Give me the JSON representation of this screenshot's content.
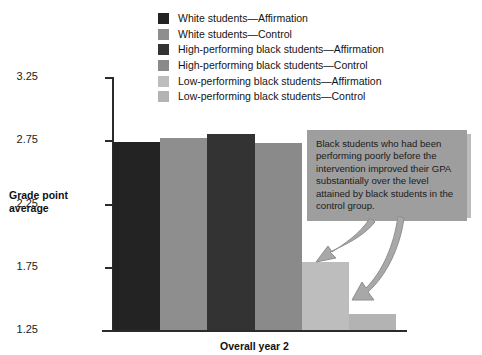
{
  "chart_data": {
    "type": "bar",
    "title": "",
    "subtitle": "",
    "xlabel": "Overall year 2",
    "ylabel": "Grade point average",
    "ylim": [
      1.25,
      3.25
    ],
    "yticks": [
      "3.25",
      "2.75",
      "2.25",
      "1.75",
      "1.25"
    ],
    "ytick_values": [
      3.25,
      2.75,
      2.25,
      1.75,
      1.25
    ],
    "grid": false,
    "legend_position": "top-center",
    "categories": [
      "White students—Affirmation",
      "White students—Control",
      "High-performing black students—Affirmation",
      "High-performing black students—Control",
      "Low-performing black students—Affirmation",
      "Low-performing black students—Control"
    ],
    "values": [
      2.74,
      2.77,
      2.8,
      2.73,
      1.79,
      1.38
    ],
    "colors": [
      "#232323",
      "#8e8e8e",
      "#333333",
      "#8a8a8a",
      "#bdbdbd",
      "#b3b3b3"
    ],
    "annotations": [
      "Black students who had been performing poorly before the intervention improved their GPA substantially over the level attained by black students in the control group."
    ]
  },
  "legend": {
    "items": [
      {
        "label": "White students—Affirmation",
        "color": "#232323"
      },
      {
        "label": "White students—Control",
        "color": "#8e8e8e"
      },
      {
        "label": "High-performing black students—Affirmation",
        "color": "#333333"
      },
      {
        "label": "High-performing black students—Control",
        "color": "#8a8a8a"
      },
      {
        "label": "Low-performing black students—Affirmation",
        "color": "#bdbdbd"
      },
      {
        "label": "Low-performing black students—Control",
        "color": "#b3b3b3"
      }
    ]
  },
  "axes": {
    "y_title": "Grade point average",
    "x_title": "Overall year 2",
    "y_ticks": [
      "3.25",
      "2.75",
      "2.25",
      "1.75",
      "1.25"
    ]
  },
  "callout": {
    "text": "Black students who had been performing poorly before the intervention improved their GPA substantially over the level attained by black students in the control group.",
    "background": "#9e9e9e"
  }
}
